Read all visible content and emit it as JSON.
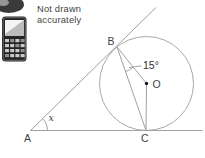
{
  "note": {
    "line1": "Not drawn",
    "line2": "accurately"
  },
  "diagram": {
    "point_labels": {
      "a": "A",
      "b": "B",
      "c": "C",
      "o": "O"
    },
    "angle_labels": {
      "at_a": "x",
      "at_b": "15°"
    },
    "colors": {
      "line": "#a0a0a0",
      "label": "#3f3f3f",
      "center_dot": "#1a1a1a"
    }
  },
  "icons": {
    "calculator": "calculator-icon",
    "partial_oval": "partial-oval-icon"
  }
}
